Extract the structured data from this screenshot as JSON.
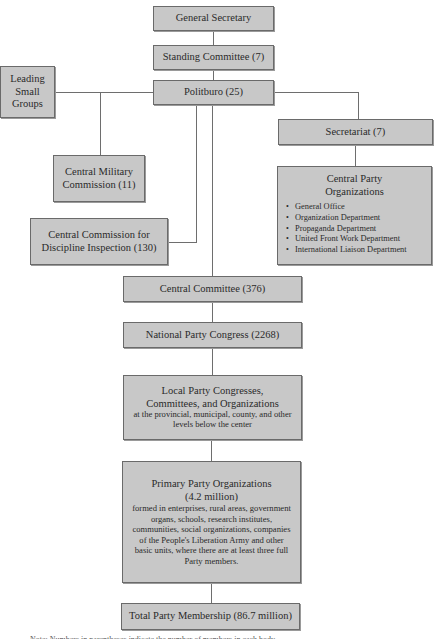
{
  "diagram": {
    "type": "org-chart",
    "nodes": {
      "general_secretary": {
        "label": "General Secretary"
      },
      "standing_committee": {
        "label": "Standing Committee (7)"
      },
      "politburo": {
        "label": "Politburo (25)"
      },
      "leading_small_groups": {
        "lines": [
          "Leading",
          "Small",
          "Groups"
        ]
      },
      "central_military_commission": {
        "lines": [
          "Central Military",
          "Commission (11)"
        ]
      },
      "ccdi": {
        "lines": [
          "Central Commission for",
          "Discipline Inspection (130)"
        ]
      },
      "secretariat": {
        "label": "Secretariat (7)"
      },
      "central_party_organizations": {
        "lines": [
          "Central Party",
          "Organizations"
        ],
        "items": [
          "General Office",
          "Organization Department",
          "Propaganda Department",
          "United Front Work Department",
          "International Liaison Department"
        ]
      },
      "central_committee": {
        "label": "Central Committee (376)"
      },
      "national_party_congress": {
        "label": "National Party Congress (2268)"
      },
      "local_party": {
        "lines": [
          "Local Party Congresses,",
          "Committees, and Organizations"
        ],
        "sub": "at the provincial, municipal, county, and other levels below the center"
      },
      "primary_party": {
        "lines": [
          "Primary Party Organizations",
          "(4.2 million)"
        ],
        "sub": "formed in enterprises, rural areas, government organs, schools, research institutes, communities, social organizations, companies of the People's Liberation Army and other basic units, where there are at least three full Party members."
      },
      "total_membership": {
        "label": "Total Party Membership (86.7 million)"
      }
    },
    "edges": [
      [
        "general_secretary",
        "standing_committee"
      ],
      [
        "standing_committee",
        "politburo"
      ],
      [
        "politburo",
        "leading_small_groups"
      ],
      [
        "politburo",
        "central_military_commission"
      ],
      [
        "politburo",
        "ccdi"
      ],
      [
        "politburo",
        "secretariat"
      ],
      [
        "secretariat",
        "central_party_organizations"
      ],
      [
        "politburo",
        "central_committee"
      ],
      [
        "central_committee",
        "national_party_congress"
      ],
      [
        "national_party_congress",
        "local_party"
      ],
      [
        "local_party",
        "primary_party"
      ],
      [
        "primary_party",
        "total_membership"
      ]
    ],
    "colors": {
      "box_fill": "#c8c8c8",
      "box_border": "#6a6a6a",
      "line": "#6e6e6e",
      "text": "#2a2a2a"
    },
    "footnote": "Note: Numbers in parentheses indicate the number of members in each body."
  }
}
